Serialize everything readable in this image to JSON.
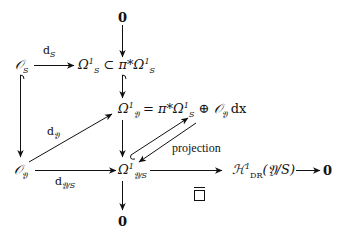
{
  "diagram": {
    "nodes": {
      "zero_top": "0",
      "O_S": "𝒪",
      "O_S_sub": "S",
      "Omega1_S": "Ω",
      "Omega1_S_sup": "1",
      "Omega1_S_sub": "S",
      "subset": "⊂",
      "pi_star_Omega1_S": "π*Ω",
      "pi_sup": "1",
      "pi_sub": "S",
      "Omega1_Y_lhs": "Ω",
      "Omega1_Y_sup": "1",
      "Omega1_Y_sub": "𝔜",
      "Omega1_Y_eq": " = π*Ω",
      "Omega1_Y_eq_sup": "1",
      "Omega1_Y_eq_sub": "S",
      "oplus": " ⊕ ",
      "O_Y_dx": "𝒪",
      "O_Y_dx_sub": "𝔜",
      "dx": " dx",
      "O_Y": "𝒪",
      "O_Y_sub": "𝔜",
      "Omega1_YS": "Ω",
      "Omega1_YS_sup": "1",
      "Omega1_YS_sub": "𝔜/S",
      "H1_DR": "ℋ",
      "H1_DR_sup": "1",
      "H1_DR_sub": "DR",
      "H1_DR_arg": "(𝔜/S)",
      "zero_right": "0",
      "zero_bottom": "0"
    },
    "arrow_labels": {
      "d_S": "d",
      "d_S_sub": "S",
      "d_Y": "d",
      "d_Y_sub": "𝔜",
      "d_YS": "d",
      "d_YS_sub": "𝔜/S",
      "projection": "projection",
      "overline_box": "□"
    },
    "arrows": [
      {
        "from": "0",
        "to": "π*Ω¹_S",
        "type": "arrow"
      },
      {
        "from": "𝒪_S",
        "to": "Ω¹_S",
        "label": "d_S",
        "type": "arrow"
      },
      {
        "from": "π*Ω¹_S",
        "to": "Ω¹_𝔜",
        "type": "hook-arrow"
      },
      {
        "from": "𝒪_S",
        "to": "𝒪_𝔜",
        "type": "hook-arrow"
      },
      {
        "from": "𝒪_𝔜",
        "to": "Ω¹_𝔜",
        "label": "d_𝔜",
        "type": "arrow"
      },
      {
        "from": "𝒪_𝔜",
        "to": "Ω¹_𝔜/S",
        "label": "d_𝔜/S",
        "type": "arrow"
      },
      {
        "from": "Ω¹_𝔜",
        "to": "Ω¹_𝔜/S",
        "type": "arrow"
      },
      {
        "from": "Ω¹_𝔜/S",
        "to": "Ω¹_𝔜",
        "type": "hook-arrow"
      },
      {
        "from": "Ω¹_𝔜",
        "to": "Ω¹_𝔜/S",
        "label": "projection",
        "type": "arrow"
      },
      {
        "from": "Ω¹_𝔜/S",
        "to": "ℋ¹_DR(𝔜/S)",
        "label": "overline-box",
        "type": "arrow"
      },
      {
        "from": "ℋ¹_DR(𝔜/S)",
        "to": "0",
        "type": "arrow"
      },
      {
        "from": "Ω¹_𝔜/S",
        "to": "0",
        "type": "arrow"
      }
    ],
    "stroke_color": "#111111"
  }
}
